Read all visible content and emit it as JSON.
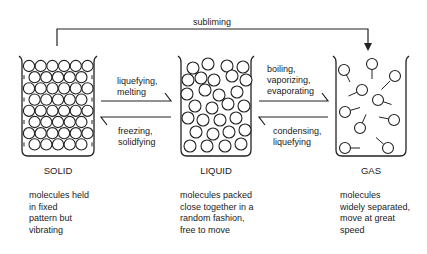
{
  "subliming": {
    "label": "subliming"
  },
  "transitions": {
    "solid_to_liquid": [
      "liquefying,",
      "melting"
    ],
    "liquid_to_solid": [
      "freezing,",
      "solidfying"
    ],
    "liquid_to_gas": [
      "boiling,",
      "vaporizing,",
      "evaporating"
    ],
    "gas_to_liquid": [
      "condensing,",
      "liquefying"
    ]
  },
  "states": [
    {
      "name": "SOLID",
      "description": [
        "molecules held",
        "in fixed",
        "pattern but",
        "vibrating"
      ]
    },
    {
      "name": "LIQUID",
      "description": [
        "molecules packed",
        "close together in a",
        "random fashion,",
        "free to move"
      ]
    },
    {
      "name": "GAS",
      "description": [
        "molecules",
        "widely separated,",
        "move at great",
        "speed"
      ]
    }
  ]
}
